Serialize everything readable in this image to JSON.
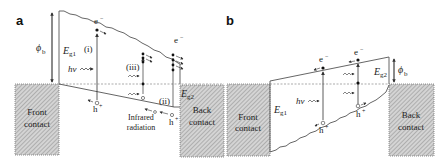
{
  "figure": {
    "panels": [
      {
        "id": "a",
        "label": "a",
        "labels": {
          "barrier": "ϕ",
          "barrier_sub": "b",
          "gap1": "E",
          "gap1_sub": "g1",
          "gap2": "E",
          "gap2_sub": "g2",
          "photon": "hν",
          "electron": "e",
          "electron_sup": "−",
          "hole": "h",
          "hole_sup": "+",
          "process_i": "(i)",
          "process_ii": "(ii)",
          "process_iii": "(iii)",
          "infrared_1": "Infrared",
          "infrared_2": "radiation",
          "front_contact_1": "Front",
          "front_contact_2": "contact",
          "back_contact_1": "Back",
          "back_contact_2": "contact"
        }
      },
      {
        "id": "b",
        "label": "b",
        "labels": {
          "barrier": "ϕ",
          "barrier_sub": "b",
          "gap1": "E",
          "gap1_sub": "g1",
          "gap2": "E",
          "gap2_sub": "g2",
          "photon": "hν",
          "electron": "e",
          "electron_sup": "−",
          "hole": "h",
          "hole_sup": "+",
          "front_contact_1": "Front",
          "front_contact_2": "contact",
          "back_contact_1": "Back",
          "back_contact_2": "contact"
        }
      }
    ],
    "colors": {
      "line": "#555555",
      "contact_fill": "#cfcfcf",
      "hatch": "#8a8a8a",
      "text": "#222222"
    }
  }
}
